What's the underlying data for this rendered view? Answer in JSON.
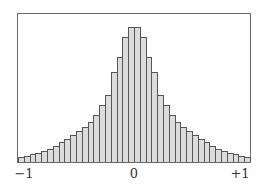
{
  "chart_data": {
    "type": "bar",
    "title": "",
    "xlabel": "",
    "ylabel": "",
    "xlim": [
      -1,
      1
    ],
    "grid": false,
    "legend": null,
    "bin_count": 40,
    "x_tick_labels": [
      "−1",
      "0",
      "+1"
    ],
    "x_tick_positions": [
      -1,
      0,
      1
    ],
    "values": [
      5,
      6,
      8,
      9,
      11,
      13,
      16,
      20,
      23,
      27,
      31,
      35,
      40,
      47,
      57,
      67,
      90,
      105,
      125,
      135,
      135,
      125,
      105,
      90,
      67,
      57,
      47,
      40,
      35,
      31,
      27,
      23,
      20,
      16,
      13,
      11,
      9,
      8,
      6,
      5
    ],
    "colors": {
      "bar_fill": "#dcdcdc",
      "bar_edge": "#555555",
      "frame": "#6a6a6a"
    }
  }
}
